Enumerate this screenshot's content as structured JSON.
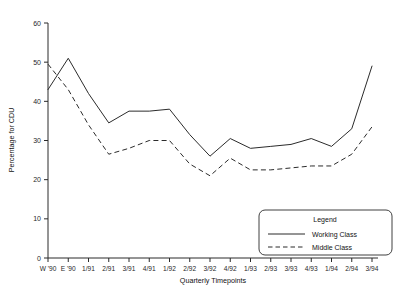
{
  "chart_data": {
    "type": "line",
    "title": "",
    "xlabel": "Quarterly Timepoints",
    "ylabel": "Percentage for CDU",
    "ylim": [
      0,
      60
    ],
    "yticks": [
      0,
      10,
      20,
      30,
      40,
      50,
      60
    ],
    "grid": false,
    "legend_position": "bottom-right",
    "legend_title": "Legend",
    "categories": [
      "W '90",
      "E '90",
      "1/91",
      "2/91",
      "3/91",
      "4/91",
      "1/92",
      "2/92",
      "3/92",
      "4/92",
      "1/93",
      "2/93",
      "3/93",
      "4/93",
      "1/94",
      "2/94",
      "3/94"
    ],
    "series": [
      {
        "name": "Working Class",
        "style": "solid",
        "values": [
          43.0,
          51.0,
          42.0,
          34.5,
          37.5,
          37.5,
          38.0,
          31.5,
          26.0,
          30.5,
          28.0,
          28.5,
          29.0,
          30.5,
          28.5,
          33.0,
          49.0
        ]
      },
      {
        "name": "Middle Class",
        "style": "dashed",
        "values": [
          49.5,
          43.0,
          34.0,
          26.5,
          28.0,
          30.0,
          30.0,
          24.0,
          21.0,
          25.5,
          22.5,
          22.5,
          23.0,
          23.5,
          23.5,
          26.5,
          33.5
        ]
      }
    ]
  },
  "axes": {
    "y_title": "Percentage for CDU",
    "x_title": "Quarterly Timepoints",
    "y_tick_labels": [
      "0",
      "10",
      "20",
      "30",
      "40",
      "50",
      "60"
    ],
    "x_tick_labels": [
      "W '90",
      "E '90",
      "1/91",
      "2/91",
      "3/91",
      "4/91",
      "1/92",
      "2/92",
      "3/92",
      "4/92",
      "1/93",
      "2/93",
      "3/93",
      "4/93",
      "1/94",
      "2/94",
      "3/94"
    ]
  },
  "legend": {
    "title": "Legend",
    "entries": [
      {
        "label": "Working Class",
        "style": "solid"
      },
      {
        "label": "Middle Class",
        "style": "dashed"
      }
    ]
  },
  "colors": {
    "line": "#2b2b2b",
    "axis": "#2a2a2a",
    "background": "#ffffff"
  }
}
